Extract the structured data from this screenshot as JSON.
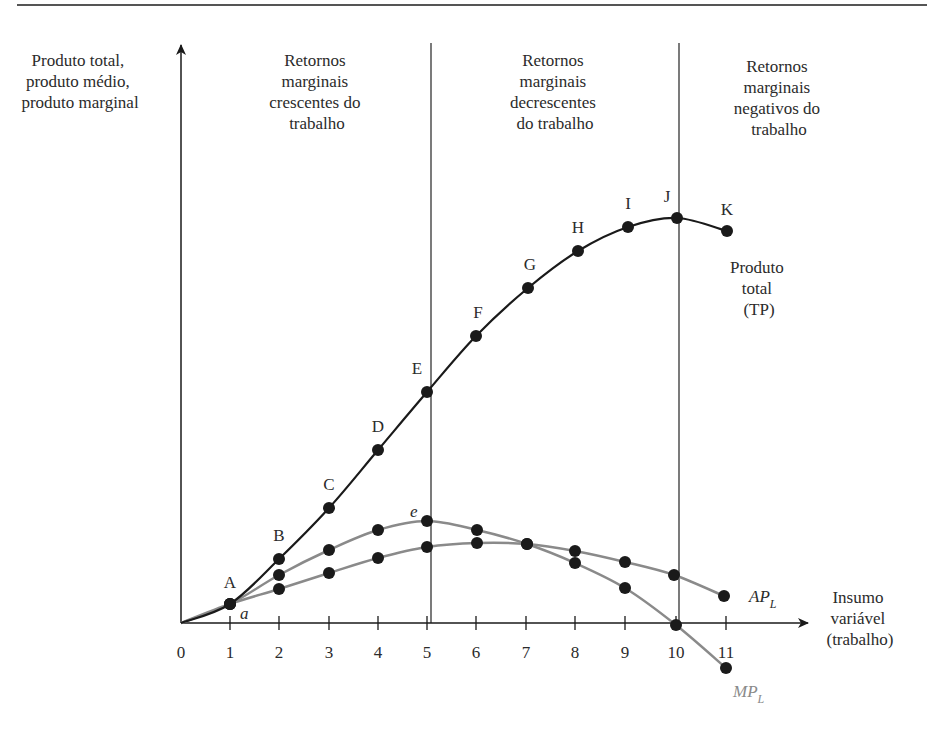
{
  "chart_data": {
    "type": "line",
    "title": "",
    "ylabel": [
      "Produto total,",
      "produto médio,",
      "produto marginal"
    ],
    "xlabel": [
      "Insumo",
      "variável",
      "(trabalho)"
    ],
    "x": [
      0,
      1,
      2,
      3,
      4,
      5,
      6,
      7,
      8,
      9,
      10,
      11
    ],
    "x_tick_labels": [
      "0",
      "1",
      "2",
      "3",
      "4",
      "5",
      "6",
      "7",
      "8",
      "9",
      "10",
      "11"
    ],
    "grid": false,
    "regions": [
      {
        "name": "crescentes",
        "label": [
          "Retornos",
          "marginais",
          "crescentes do",
          "trabalho"
        ],
        "x_range": [
          0,
          5
        ]
      },
      {
        "name": "decrescentes",
        "label": [
          "Retornos",
          "marginais",
          "decrescentes",
          "do trabalho"
        ],
        "x_range": [
          5,
          10
        ]
      },
      {
        "name": "negativos",
        "label": [
          "Retornos",
          "marginais",
          "negativos do",
          "trabalho"
        ],
        "x_range": [
          10,
          11
        ]
      }
    ],
    "dividers_at_x": [
      5,
      10
    ],
    "series": [
      {
        "name": "Produto total (TP)",
        "label": [
          "Produto",
          "total",
          "(TP)"
        ],
        "color": "#1a1a1a",
        "x": [
          1,
          2,
          3,
          4,
          5,
          6,
          7,
          8,
          9,
          10,
          11
        ],
        "point_labels": [
          "A",
          "B",
          "C",
          "D",
          "E",
          "F",
          "G",
          "H",
          "I",
          "J",
          "K"
        ],
        "values": [
          0.4,
          1.3,
          2.3,
          3.5,
          4.6,
          5.7,
          6.7,
          7.4,
          7.9,
          8.1,
          7.8
        ],
        "px": [
          [
            230,
            604
          ],
          [
            279,
            559
          ],
          [
            329,
            508
          ],
          [
            378,
            450
          ],
          [
            427,
            392
          ],
          [
            476,
            336
          ],
          [
            528,
            288
          ],
          [
            578,
            251
          ],
          [
            628,
            227
          ],
          [
            677,
            218
          ],
          [
            727,
            231
          ]
        ]
      },
      {
        "name": "MP_L",
        "label_main": "MP",
        "label_sub": "L",
        "color": "#8a8a8a",
        "x": [
          1,
          2,
          3,
          4,
          5,
          6,
          7,
          8,
          9,
          10,
          11
        ],
        "values": [
          0.4,
          1.0,
          1.45,
          1.85,
          2.0,
          1.85,
          1.55,
          1.2,
          0.7,
          0.0,
          -0.9
        ],
        "annotations": [
          {
            "x": 1,
            "text": "a"
          },
          {
            "x": 5,
            "text": "e"
          }
        ],
        "px": [
          [
            230,
            604
          ],
          [
            279,
            575
          ],
          [
            329,
            550
          ],
          [
            378,
            530
          ],
          [
            427,
            521
          ],
          [
            477,
            530
          ],
          [
            527,
            544
          ],
          [
            575,
            563
          ],
          [
            625,
            588
          ],
          [
            676,
            625
          ],
          [
            726,
            668
          ]
        ]
      },
      {
        "name": "AP_L",
        "label_main": "AP",
        "label_sub": "L",
        "color": "#8a8a8a",
        "x": [
          1,
          2,
          3,
          4,
          5,
          6,
          7,
          8,
          9,
          10,
          11
        ],
        "values": [
          0.4,
          0.7,
          1.0,
          1.3,
          1.55,
          1.62,
          1.58,
          1.45,
          1.25,
          1.0,
          0.55
        ],
        "px": [
          [
            230,
            604
          ],
          [
            279,
            589
          ],
          [
            329,
            573
          ],
          [
            378,
            558
          ],
          [
            427,
            547
          ],
          [
            477,
            543
          ],
          [
            527,
            544
          ],
          [
            575,
            551
          ],
          [
            625,
            562
          ],
          [
            674,
            575
          ],
          [
            724,
            596
          ]
        ]
      }
    ],
    "axis_px": {
      "origin": [
        181,
        623
      ],
      "x_end": [
        925,
        623
      ],
      "y_top": [
        181,
        45
      ],
      "tick_x": [
        230,
        279,
        329,
        378,
        427,
        476,
        526,
        575,
        625,
        676,
        726
      ]
    }
  }
}
